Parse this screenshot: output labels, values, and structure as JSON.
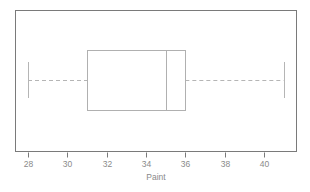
{
  "chart_data": {
    "type": "box",
    "title": "",
    "xlabel": "Paint",
    "ylabel": "",
    "orientation": "horizontal",
    "xlim": [
      26.9,
      42.0
    ],
    "grid": false,
    "legend": null,
    "tick_labels": [
      "28",
      "30",
      "32",
      "34",
      "36",
      "38",
      "40"
    ],
    "tick_values": [
      28,
      30,
      32,
      34,
      36,
      38,
      40
    ],
    "boxes": [
      {
        "name": "Paint",
        "min": 28,
        "q1": 31,
        "median": 35,
        "q3": 36,
        "max": 41,
        "outliers": []
      }
    ],
    "annotations": []
  },
  "style": {
    "frame_color": "#7a7a7a",
    "box_color": "#b0b0b0",
    "whisker_color": "#b5b5b5",
    "median_color": "#b0b0b0",
    "text_color": "#8a8a8a",
    "background": "#ffffff"
  },
  "geometry": {
    "frame": {
      "x": 15,
      "y": 10,
      "width": 282,
      "height": 142
    },
    "box_top": 50,
    "box_bottom": 110,
    "center_y": 80,
    "cap_top": 62,
    "cap_bottom": 98,
    "px_per_unit": 19.667,
    "x_at_28": 28
  }
}
